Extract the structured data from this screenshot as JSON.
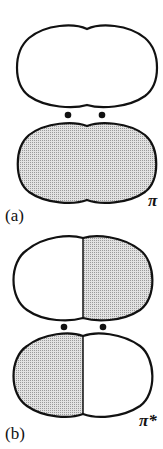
{
  "figure": {
    "panels": [
      {
        "id": "a",
        "label": "(a)",
        "orbital_label": "π",
        "description": "Bonding pi orbital: upper lobe unshaded, lower lobe shaded, two atom nuclei between lobes",
        "upper_lobe": {
          "shading": "none"
        },
        "lower_lobe": {
          "shading": "dotted"
        },
        "nuclei_count": 2
      },
      {
        "id": "b",
        "label": "(b)",
        "orbital_label": "π*",
        "description": "Antibonding pi* orbital with nodal plane: upper lobe right half shaded, lower lobe left half shaded, two atom nuclei between lobes",
        "upper_lobe": {
          "left_shading": "none",
          "right_shading": "dotted"
        },
        "lower_lobe": {
          "left_shading": "dotted",
          "right_shading": "none"
        },
        "nuclei_count": 2
      }
    ],
    "colors": {
      "outline": "#111111",
      "shade": "#c8c8c8",
      "background": "#ffffff"
    }
  }
}
